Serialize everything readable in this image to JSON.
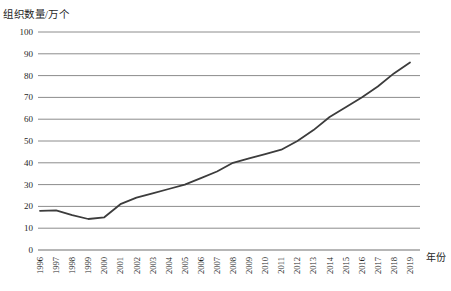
{
  "chart": {
    "y_axis_title": "组织数量/万个",
    "x_axis_title": "年份",
    "colors": {
      "line": "#3c3c3c",
      "grid": "#8c8c8c",
      "axis": "#6f6f6f",
      "text": "#1f1f1f",
      "background": "#ffffff"
    }
  },
  "chart_data": {
    "type": "line",
    "title": "",
    "xlabel": "年份",
    "ylabel": "组织数量/万个",
    "x": [
      1996,
      1997,
      1998,
      1999,
      2000,
      2001,
      2002,
      2003,
      2004,
      2005,
      2006,
      2007,
      2008,
      2009,
      2010,
      2011,
      2012,
      2013,
      2014,
      2015,
      2016,
      2017,
      2018,
      2019
    ],
    "y": [
      18,
      18.2,
      16,
      14.2,
      15,
      21,
      24,
      26,
      28,
      30,
      33,
      36,
      40,
      42,
      44,
      46,
      50,
      55,
      61,
      65.5,
      70,
      75,
      81,
      86
    ],
    "series_name": "组织数量",
    "ylim": [
      0,
      100
    ],
    "yticks": [
      0,
      10,
      20,
      30,
      40,
      50,
      60,
      70,
      80,
      90,
      100
    ],
    "grid": "horizontal",
    "legend": "none",
    "marker": "none"
  }
}
